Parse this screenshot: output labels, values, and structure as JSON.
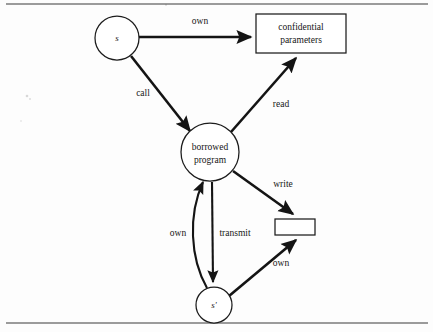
{
  "figure": {
    "background_color": "#fdfdfd",
    "ink_color": "#141414",
    "nodes": [
      {
        "id": "s",
        "shape": "circle",
        "label": "s",
        "style": "italic",
        "cx": 117,
        "cy": 38,
        "r": 22
      },
      {
        "id": "confidential-parameters",
        "shape": "rectangle",
        "label_line1": "confidential",
        "label_line2": "parameters",
        "x": 256,
        "y": 14,
        "width": 90,
        "height": 39
      },
      {
        "id": "borrowed-program",
        "shape": "circle",
        "label_line1": "borrowed",
        "label_line2": "program",
        "cx": 210,
        "cy": 152,
        "r": 29
      },
      {
        "id": "unlabeled-box",
        "shape": "rectangle",
        "label": "",
        "x": 275,
        "y": 219,
        "width": 40,
        "height": 16
      },
      {
        "id": "s-prime",
        "shape": "circle",
        "label": "s'",
        "style": "italic",
        "cx": 214,
        "cy": 305,
        "r": 18
      }
    ],
    "edges": [
      {
        "id": "s-to-confidential",
        "from": "s",
        "to": "confidential-parameters",
        "label": "own",
        "label_x": 200,
        "label_y": 22
      },
      {
        "id": "s-to-borrowed",
        "from": "s",
        "to": "borrowed-program",
        "label": "call",
        "label_x": 143,
        "label_y": 93
      },
      {
        "id": "borrowed-to-confidential",
        "from": "borrowed-program",
        "to": "confidential-parameters",
        "label": "read",
        "label_x": 281,
        "label_y": 104
      },
      {
        "id": "borrowed-to-box",
        "from": "borrowed-program",
        "to": "unlabeled-box",
        "label": "write",
        "label_x": 283,
        "label_y": 184
      },
      {
        "id": "sprime-to-borrowed",
        "from": "s-prime",
        "to": "borrowed-program",
        "label": "own",
        "label_x": 178,
        "label_y": 233,
        "curved": true
      },
      {
        "id": "borrowed-to-sprime",
        "from": "borrowed-program",
        "to": "s-prime",
        "label": "transmit",
        "label_x": 234,
        "label_y": 233
      },
      {
        "id": "sprime-to-box",
        "from": "s-prime",
        "to": "unlabeled-box",
        "label": "own",
        "label_x": 281,
        "label_y": 263
      }
    ],
    "rules": [
      {
        "id": "top-rule",
        "x1": 6,
        "y1": 4,
        "x2": 428,
        "y2": 4
      },
      {
        "id": "bottom-rule",
        "x1": 6,
        "y1": 323,
        "x2": 428,
        "y2": 323
      }
    ]
  }
}
